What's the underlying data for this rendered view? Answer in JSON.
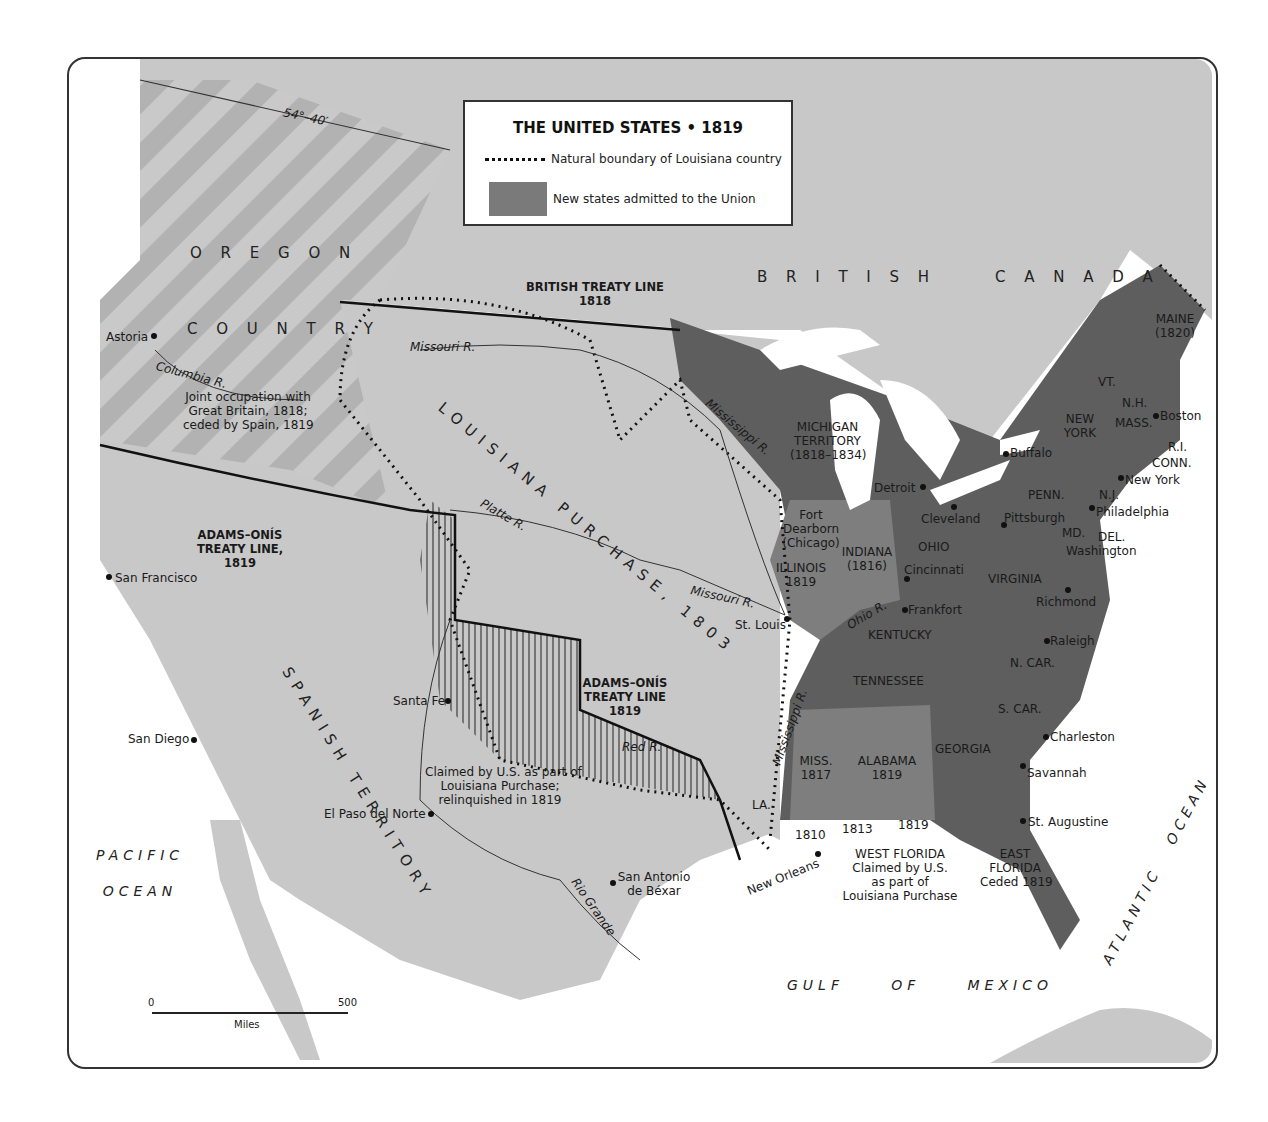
{
  "legend": {
    "title": "THE UNITED STATES • 1819",
    "dotted_line_label": "Natural boundary of Louisiana country",
    "swatch_label": "New states admitted to the Union",
    "colors": {
      "new_states": "#7a7a7a",
      "old_states": "#5e5e5e",
      "territory": "#c8c8c8",
      "water": "#ffffff",
      "oregon_stripe": "#b0b0b0"
    }
  },
  "regions": {
    "oregon": [
      "O R E G O N",
      "C O U N T R Y"
    ],
    "oregon_note": [
      "Joint occupation with",
      "Great Britain, 1818;",
      "ceded by Spain, 1819"
    ],
    "british_canada": "B R I T I S H     C A N A D A",
    "louisiana": "LOUISIANA PURCHASE, 1803",
    "spanish": "SPANISH TERRITORY",
    "michigan": [
      "MICHIGAN",
      "TERRITORY",
      "(1818–1834)"
    ],
    "claimed_note": [
      "Claimed by U.S. as part of",
      "Louisiana Purchase;",
      "relinquished in 1819"
    ],
    "west_florida": [
      "WEST FLORIDA",
      "Claimed by U.S.",
      "as part of",
      "Louisiana Purchase"
    ],
    "east_florida": [
      "EAST",
      "FLORIDA",
      "Ceded 1819"
    ],
    "wf_years": [
      "1810",
      "1813",
      "1819"
    ]
  },
  "treaty_lines": {
    "latitude": "54°–40′",
    "british": [
      "BRITISH TREATY LINE",
      "1818"
    ],
    "adams_onis_west": [
      "ADAMS–ONÍS",
      "TREATY LINE,",
      "1819"
    ],
    "adams_onis_east": [
      "ADAMS–ONÍS",
      "TREATY LINE",
      "1819"
    ]
  },
  "states": {
    "maine": [
      "MAINE",
      "(1820)"
    ],
    "vt": "VT.",
    "nh": "N.H.",
    "mass": "MASS.",
    "ri": "R.I.",
    "conn": "CONN.",
    "ny": [
      "NEW",
      "YORK"
    ],
    "penn": "PENN.",
    "nj": "N.J.",
    "md": "MD.",
    "del": "DEL.",
    "ohio": "OHIO",
    "indiana": [
      "INDIANA",
      "(1816)"
    ],
    "illinois": [
      "ILLINOIS",
      "1819"
    ],
    "virginia": "VIRGINIA",
    "kentucky": "KENTUCKY",
    "ncar": "N. CAR.",
    "tennessee": "TENNESSEE",
    "scar": "S. CAR.",
    "georgia": "GEORGIA",
    "miss": [
      "MISS.",
      "1817"
    ],
    "alabama": [
      "ALABAMA",
      "1819"
    ],
    "la": "LA."
  },
  "cities": {
    "astoria": "Astoria",
    "san_francisco": "San Francisco",
    "san_diego": "San Diego",
    "santa_fe": "Santa Fe",
    "el_paso": "El Paso del Norte",
    "san_antonio": [
      "San Antonio",
      "de Béxar"
    ],
    "new_orleans": "New Orleans",
    "st_louis": "St. Louis",
    "fort_dearborn": [
      "Fort",
      "Dearborn",
      "(Chicago)"
    ],
    "detroit": "Detroit",
    "cleveland": "Cleveland",
    "cincinnati": "Cincinnati",
    "frankfort": "Frankfort",
    "pittsburgh": "Pittsburgh",
    "buffalo": "Buffalo",
    "philadelphia": "Philadelphia",
    "washington": "Washington",
    "new_york": "New York",
    "boston": "Boston",
    "richmond": "Richmond",
    "raleigh": "Raleigh",
    "charleston": "Charleston",
    "savannah": "Savannah",
    "st_augustine": "St. Augustine"
  },
  "rivers": {
    "columbia": "Columbia R.",
    "missouri": "Missouri R.",
    "platte": "Platte R.",
    "mississippi": "Mississippi R.",
    "ohio": "Ohio R.",
    "red": "Red R.",
    "rio_grande": "Rio Grande"
  },
  "oceans": {
    "pacific": [
      "PACIFIC",
      "OCEAN"
    ],
    "atlantic": "ATLANTIC   OCEAN",
    "gulf": "GULF     OF     MEXICO"
  },
  "scale": {
    "start": "0",
    "end": "500",
    "unit": "Miles"
  }
}
